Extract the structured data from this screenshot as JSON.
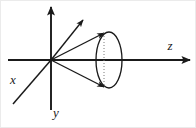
{
  "figure": {
    "type": "line-diagram",
    "background_color": "#ffffff",
    "stroke_color": "#1a1a1a",
    "canvas": {
      "width": 196,
      "height": 128
    },
    "origin": {
      "x": 51,
      "y": 60
    }
  },
  "axes": [
    {
      "id": "x",
      "label": "x",
      "label_x": 13,
      "label_y": 84,
      "font_size": 13,
      "direction": "lower-left diagonal",
      "has_arrowhead": false,
      "from": {
        "x": 51,
        "y": 60
      },
      "to": {
        "x": 13,
        "y": 104
      }
    },
    {
      "id": "y",
      "label": "y",
      "label_x": 56,
      "label_y": 117,
      "font_size": 13,
      "direction": "vertical (up-down)",
      "has_arrowhead": true,
      "arrow_at": "top",
      "from": {
        "x": 51,
        "y": 110
      },
      "to": {
        "x": 51,
        "y": 7
      }
    },
    {
      "id": "z",
      "label": "z",
      "label_x": 170,
      "label_y": 50,
      "font_size": 13,
      "direction": "horizontal (left-right)",
      "has_arrowhead": true,
      "arrow_at": "right",
      "from": {
        "x": 8,
        "y": 60
      },
      "to": {
        "x": 190,
        "y": 60
      }
    }
  ],
  "rays": [
    {
      "id": "diagonal-ray",
      "description": "arrow from origin to upper right",
      "from": {
        "x": 51,
        "y": 60
      },
      "to": {
        "x": 83,
        "y": 20
      },
      "has_arrowhead": true
    },
    {
      "id": "cone-upper-generator",
      "description": "arrow from origin to top of ellipse",
      "from": {
        "x": 51,
        "y": 60
      },
      "to": {
        "x": 104,
        "y": 33
      },
      "has_arrowhead": true
    },
    {
      "id": "cone-lower-generator",
      "description": "arrow from origin to bottom of ellipse",
      "from": {
        "x": 51,
        "y": 60
      },
      "to": {
        "x": 104,
        "y": 87
      },
      "has_arrowhead": true
    }
  ],
  "ellipse": {
    "id": "cone-base-ellipse",
    "description": "circular cone base seen in perspective",
    "center": {
      "x": 109,
      "y": 60
    },
    "rx": 13,
    "ry": 28,
    "stroke_width": 1.3,
    "fill": "none"
  },
  "dotted_diameter": {
    "id": "ellipse-vertical-diameter",
    "description": "dotted vertical line inside ellipse",
    "x": 104,
    "y1": 33,
    "y2": 87,
    "dash": "1,2"
  },
  "border": {
    "visible": true,
    "color": "#e8e8e8",
    "width": 1
  }
}
